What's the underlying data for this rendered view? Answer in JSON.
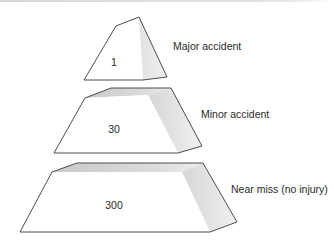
{
  "diagram": {
    "type": "accident-ratio-pyramid",
    "tiers": [
      {
        "value": "1",
        "label": "Major accident",
        "front": [
          [
            84,
            80
          ],
          [
            116,
            26
          ],
          [
            139,
            17
          ],
          [
            143,
            80
          ]
        ],
        "side": [
          [
            116,
            26
          ],
          [
            139,
            17
          ],
          [
            167,
            77
          ],
          [
            143,
            80
          ]
        ],
        "value_pos": [
          114,
          66
        ],
        "label_pos": [
          173,
          50
        ]
      },
      {
        "value": "30",
        "label": "Minor accident",
        "front": [
          [
            54,
            153
          ],
          [
            85,
            98
          ],
          [
            148,
            95
          ],
          [
            178,
            153
          ]
        ],
        "top": [
          [
            85,
            98
          ],
          [
            111,
            88
          ],
          [
            171,
            88
          ],
          [
            148,
            95
          ]
        ],
        "side": [
          [
            148,
            95
          ],
          [
            171,
            88
          ],
          [
            202,
            146
          ],
          [
            178,
            153
          ]
        ],
        "value_pos": [
          114,
          133
        ],
        "label_pos": [
          201,
          118
        ]
      },
      {
        "value": "300",
        "label": "Near miss (no injury)",
        "front": [
          [
            20,
            232
          ],
          [
            52,
            172
          ],
          [
            182,
            172
          ],
          [
            210,
            232
          ]
        ],
        "top": [
          [
            52,
            172
          ],
          [
            77,
            163
          ],
          [
            203,
            163
          ],
          [
            182,
            172
          ]
        ],
        "side": [
          [
            182,
            172
          ],
          [
            203,
            163
          ],
          [
            237,
            222
          ],
          [
            210,
            232
          ]
        ],
        "value_pos": [
          114,
          209
        ],
        "label_pos": [
          231,
          193
        ]
      }
    ],
    "colors": {
      "front_fill": "#ffffff",
      "top_fill": "#d9d9d9",
      "side_fill": "#e9e9e9",
      "edge": "#3a3a3a",
      "text": "#2a2a2a"
    }
  }
}
